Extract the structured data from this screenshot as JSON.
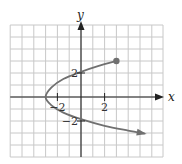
{
  "chart_data": {
    "type": "line",
    "title": "",
    "xlabel": "x",
    "ylabel": "y",
    "xlim": [
      -6,
      7
    ],
    "ylim": [
      -5,
      6
    ],
    "grid": true,
    "grid_step": 1,
    "x_ticks": [
      {
        "value": -2,
        "label": "-2"
      },
      {
        "value": 2,
        "label": "2"
      }
    ],
    "y_ticks": [
      {
        "value": 2,
        "label": "2"
      },
      {
        "value": -2,
        "label": "-2"
      }
    ],
    "series": [
      {
        "name": "curve",
        "description": "Sideways parabola opening right, vertex at (-3, 0); upper branch ends at closed point (3, 3); lower branch continues with arrow",
        "points": [
          {
            "x": 3,
            "y": 3
          },
          {
            "x": 1.5,
            "y": 2.6
          },
          {
            "x": 0,
            "y": 2.1
          },
          {
            "x": -1.5,
            "y": 1.5
          },
          {
            "x": -2.5,
            "y": 0.8
          },
          {
            "x": -3,
            "y": 0
          },
          {
            "x": -2.5,
            "y": -0.7
          },
          {
            "x": -1.5,
            "y": -1.3
          },
          {
            "x": 0,
            "y": -1.85
          },
          {
            "x": 2,
            "y": -2.4
          },
          {
            "x": 4,
            "y": -2.8
          },
          {
            "x": 5.4,
            "y": -3.05
          }
        ],
        "start_marker": "closed-dot",
        "end_marker": "arrow"
      }
    ],
    "colors": {
      "curve": "#707070",
      "grid": "#c8c8c8",
      "axis": "#222222"
    }
  }
}
